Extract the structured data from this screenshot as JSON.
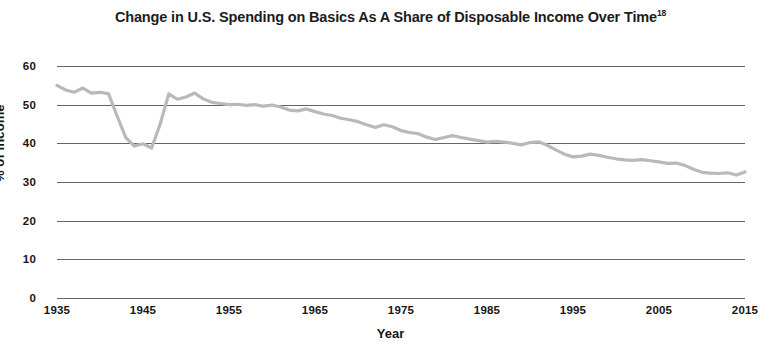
{
  "chart_data": {
    "type": "line",
    "title": "Change in U.S. Spending on Basics As A Share of Disposable Income Over Time",
    "title_superscript": "18",
    "xlabel": "Year",
    "ylabel": "% of income",
    "xlim": [
      1935,
      2015
    ],
    "ylim": [
      0,
      60
    ],
    "ytick_labels": [
      "0",
      "10",
      "20",
      "30",
      "40",
      "50",
      "60"
    ],
    "yticks": [
      0,
      10,
      20,
      30,
      40,
      50,
      60
    ],
    "xtick_labels": [
      "1935",
      "1945",
      "1955",
      "1965",
      "1975",
      "1985",
      "1995",
      "2005",
      "2015"
    ],
    "xticks": [
      1935,
      1945,
      1955,
      1965,
      1975,
      1985,
      1995,
      2005,
      2015
    ],
    "grid": true,
    "grid_axis": "y",
    "legend": false,
    "line_color": "#b9b9b9",
    "series": [
      {
        "name": "Spending on basics as share of disposable income",
        "x": [
          1935,
          1936,
          1937,
          1938,
          1939,
          1940,
          1941,
          1942,
          1943,
          1944,
          1945,
          1946,
          1947,
          1948,
          1949,
          1950,
          1951,
          1952,
          1953,
          1954,
          1955,
          1956,
          1957,
          1958,
          1959,
          1960,
          1961,
          1962,
          1963,
          1964,
          1965,
          1966,
          1967,
          1968,
          1969,
          1970,
          1971,
          1972,
          1973,
          1974,
          1975,
          1976,
          1977,
          1978,
          1979,
          1980,
          1981,
          1982,
          1983,
          1984,
          1985,
          1986,
          1987,
          1988,
          1989,
          1990,
          1991,
          1992,
          1993,
          1994,
          1995,
          1996,
          1997,
          1998,
          1999,
          2000,
          2001,
          2002,
          2003,
          2004,
          2005,
          2006,
          2007,
          2008,
          2009,
          2010,
          2011,
          2012,
          2013,
          2014,
          2015
        ],
        "values": [
          55.0,
          53.8,
          53.2,
          54.3,
          53.0,
          53.2,
          52.8,
          47.0,
          41.5,
          39.3,
          39.9,
          38.8,
          45.0,
          52.8,
          51.4,
          52.0,
          53.0,
          51.5,
          50.6,
          50.3,
          50.0,
          50.1,
          49.8,
          50.0,
          49.6,
          49.9,
          49.4,
          48.6,
          48.4,
          48.9,
          48.2,
          47.6,
          47.2,
          46.5,
          46.1,
          45.6,
          44.8,
          44.1,
          44.8,
          44.3,
          43.3,
          42.8,
          42.5,
          41.6,
          41.0,
          41.5,
          42.0,
          41.5,
          41.1,
          40.7,
          40.3,
          40.5,
          40.3,
          40.0,
          39.6,
          40.2,
          40.4,
          39.5,
          38.3,
          37.2,
          36.5,
          36.7,
          37.2,
          36.9,
          36.4,
          36.0,
          35.7,
          35.6,
          35.8,
          35.5,
          35.2,
          34.8,
          34.9,
          34.3,
          33.3,
          32.5,
          32.3,
          32.2,
          32.4,
          31.8,
          32.6
        ]
      }
    ],
    "annotations": []
  }
}
